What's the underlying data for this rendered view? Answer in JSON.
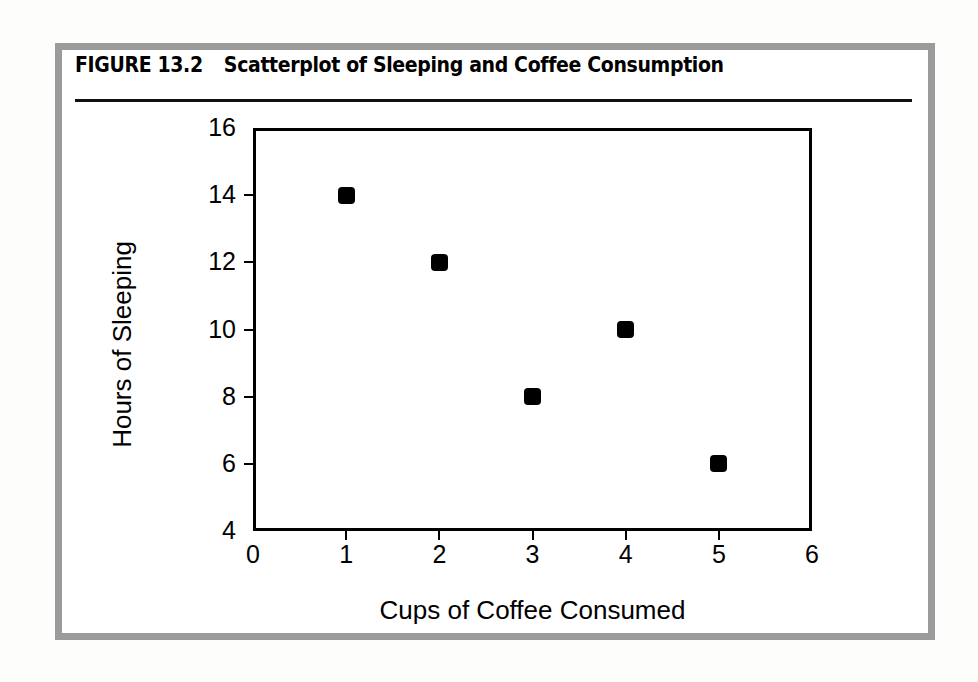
{
  "figure": {
    "number_label": "FIGURE 13.2",
    "caption": "Scatterplot of Sleeping and Coffee Consumption",
    "frame_color": "#9b9b9b",
    "rule_color": "#111111",
    "background_color": "#ffffff"
  },
  "chart_data": {
    "type": "scatter",
    "title": "Scatterplot of Sleeping and Coffee Consumption",
    "xlabel": "Cups of Coffee Consumed",
    "ylabel": "Hours of Sleeping",
    "xlim": [
      0,
      6
    ],
    "ylim": [
      4,
      16
    ],
    "xticks": [
      0,
      1,
      2,
      3,
      4,
      5,
      6
    ],
    "yticks": [
      4,
      6,
      8,
      10,
      12,
      14,
      16
    ],
    "xtick_labels": [
      "0",
      "1",
      "2",
      "3",
      "4",
      "5",
      "6"
    ],
    "ytick_labels": [
      "4",
      "6",
      "8",
      "10",
      "12",
      "14",
      "16"
    ],
    "grid": false,
    "legend": null,
    "marker": "square",
    "marker_color": "#000000",
    "points": [
      {
        "x": 1,
        "y": 14
      },
      {
        "x": 2,
        "y": 12
      },
      {
        "x": 3,
        "y": 8
      },
      {
        "x": 4,
        "y": 10
      },
      {
        "x": 5,
        "y": 6
      }
    ],
    "series": [
      {
        "name": "Sleeping vs Coffee",
        "x": [
          1,
          2,
          3,
          4,
          5
        ],
        "y": [
          14,
          12,
          8,
          10,
          6
        ]
      }
    ]
  }
}
